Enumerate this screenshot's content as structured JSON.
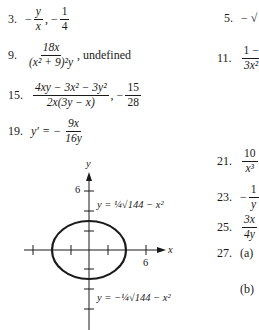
{
  "answers": [
    {
      "num": "3.",
      "expr1_top": "y",
      "expr1_bot": "x",
      "sep": ",",
      "expr2_top": "1",
      "expr2_bot": "4"
    },
    {
      "num": "9.",
      "top": "18x",
      "bot": "(x² + 9)²y",
      "tail": ", undefined"
    },
    {
      "num": "15.",
      "top": "4xy − 3x² − 3y²",
      "bot": "2x(3y − x)",
      "tail": ", − 15/28",
      "tail_top": "15",
      "tail_bot": "28"
    },
    {
      "num": "19.",
      "lhs": "y′ = −",
      "top": "9x",
      "bot": "16y"
    },
    {
      "num": "5.",
      "text": "− √"
    },
    {
      "num": "11.",
      "top": "1 −",
      "bot": "3x²"
    },
    {
      "num": "21.",
      "top": "10",
      "bot": "x³"
    },
    {
      "num": "23.",
      "top": "1",
      "bot": "y",
      "sign": "−"
    },
    {
      "num": "25.",
      "top": "3x",
      "bot": "4y"
    },
    {
      "num": "27.",
      "part_a": "(a)",
      "part_b": "(b)"
    }
  ],
  "graph": {
    "y_axis_label": "y",
    "x_axis_label": "x",
    "y_tick_label": "6",
    "x_tick_label": "6",
    "upper_curve_label": "y = ¼√144 − x²",
    "lower_curve_label": "y = −¼√144 − x²"
  }
}
